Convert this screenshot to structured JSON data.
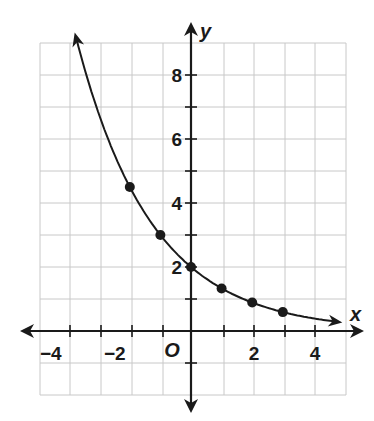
{
  "chart_data": {
    "type": "line",
    "title": "",
    "xlabel": "x",
    "ylabel": "y",
    "origin_label": "O",
    "xlim": [
      -5,
      5
    ],
    "ylim": [
      -2,
      9
    ],
    "grid": true,
    "x_ticks": [
      -4,
      -3,
      -2,
      -1,
      1,
      2,
      3,
      4
    ],
    "x_tick_labels": [
      "−4",
      "−2",
      "2",
      "4"
    ],
    "x_tick_label_values": [
      -4,
      -2,
      2,
      4
    ],
    "y_ticks": [
      -1,
      1,
      2,
      3,
      4,
      5,
      6,
      7,
      8
    ],
    "y_tick_labels": [
      "2",
      "4",
      "6",
      "8"
    ],
    "y_tick_label_values": [
      2,
      4,
      6,
      8
    ],
    "series": [
      {
        "name": "y = 2(2/3)^x",
        "kind": "curve",
        "arrows": "both-ends",
        "x": [
          -3.8,
          -3,
          -2,
          -1,
          0,
          1,
          2,
          3,
          4,
          4.8
        ],
        "values": [
          9.3,
          6.75,
          4.5,
          3,
          2,
          1.33,
          0.89,
          0.59,
          0.4,
          0.29
        ]
      },
      {
        "name": "points",
        "kind": "scatter",
        "x": [
          -2,
          -1,
          0,
          1,
          2,
          3
        ],
        "values": [
          4.5,
          3,
          2,
          1.33,
          0.89,
          0.59
        ]
      }
    ]
  },
  "labels": {
    "x_axis": "x",
    "y_axis": "y",
    "origin": "O",
    "xt_m4": "−4",
    "xt_m2": "−2",
    "xt_2": "2",
    "xt_4": "4",
    "yt_2": "2",
    "yt_4": "4",
    "yt_6": "6",
    "yt_8": "8"
  }
}
